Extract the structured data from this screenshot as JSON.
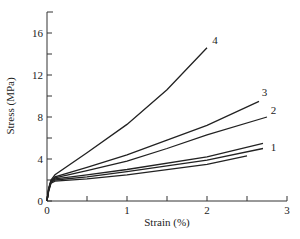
{
  "chart_data": {
    "type": "line",
    "title": "",
    "xlabel": "Strain (%)",
    "ylabel": "Stress (MPa)",
    "xlim": [
      0,
      3
    ],
    "ylim": [
      0,
      18
    ],
    "x_ticks": [
      0,
      1,
      2,
      3
    ],
    "x_minor_ticks": [
      0.5,
      1.5,
      2.5
    ],
    "y_ticks": [
      0,
      4,
      8,
      12,
      16
    ],
    "y_minor_ticks": [
      2,
      6,
      10,
      14
    ],
    "grid": false,
    "legend": "none (curves labeled inline with numbers)",
    "series": [
      {
        "name": "4",
        "label": "4",
        "points": [
          [
            0,
            0
          ],
          [
            0.02,
            1.2
          ],
          [
            0.05,
            2.0
          ],
          [
            0.1,
            2.5
          ],
          [
            0.5,
            4.6
          ],
          [
            1.0,
            7.3
          ],
          [
            1.5,
            10.6
          ],
          [
            2.0,
            14.6
          ]
        ]
      },
      {
        "name": "3",
        "label": "3",
        "points": [
          [
            0,
            0
          ],
          [
            0.02,
            1.1
          ],
          [
            0.05,
            1.9
          ],
          [
            0.1,
            2.3
          ],
          [
            0.5,
            3.2
          ],
          [
            1.0,
            4.4
          ],
          [
            1.5,
            5.8
          ],
          [
            2.0,
            7.2
          ],
          [
            2.65,
            9.5
          ]
        ]
      },
      {
        "name": "2",
        "label": "2",
        "points": [
          [
            0,
            0
          ],
          [
            0.02,
            1.1
          ],
          [
            0.05,
            1.9
          ],
          [
            0.1,
            2.2
          ],
          [
            0.5,
            2.9
          ],
          [
            1.0,
            3.8
          ],
          [
            1.5,
            5.0
          ],
          [
            2.0,
            6.3
          ],
          [
            2.75,
            8.0
          ]
        ]
      },
      {
        "name": "1a",
        "label": "1",
        "points": [
          [
            0,
            0
          ],
          [
            0.02,
            1.0
          ],
          [
            0.05,
            1.8
          ],
          [
            0.1,
            2.1
          ],
          [
            0.5,
            2.5
          ],
          [
            1.0,
            3.0
          ],
          [
            2.0,
            4.2
          ],
          [
            2.7,
            5.5
          ]
        ]
      },
      {
        "name": "1b",
        "label": "1",
        "points": [
          [
            0,
            0
          ],
          [
            0.02,
            1.0
          ],
          [
            0.05,
            1.8
          ],
          [
            0.1,
            2.0
          ],
          [
            0.5,
            2.3
          ],
          [
            1.0,
            2.8
          ],
          [
            2.0,
            3.9
          ],
          [
            2.7,
            5.0
          ]
        ]
      },
      {
        "name": "1c",
        "label": "1",
        "points": [
          [
            0,
            0
          ],
          [
            0.02,
            0.9
          ],
          [
            0.05,
            1.7
          ],
          [
            0.1,
            1.9
          ],
          [
            0.5,
            2.1
          ],
          [
            1.0,
            2.5
          ],
          [
            2.0,
            3.5
          ],
          [
            2.5,
            4.3
          ]
        ]
      }
    ],
    "annotations": [
      {
        "text": "4",
        "x": 2.1,
        "y": 15.0
      },
      {
        "text": "3",
        "x": 2.72,
        "y": 10.0
      },
      {
        "text": "2",
        "x": 2.83,
        "y": 8.3
      },
      {
        "text": "1",
        "x": 2.83,
        "y": 4.8
      }
    ]
  }
}
